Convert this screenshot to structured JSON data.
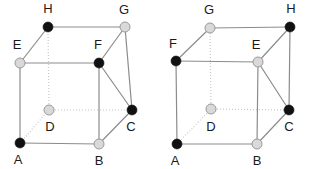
{
  "figure": {
    "background_color": "#ffffff",
    "width": 312,
    "height": 169,
    "colors": {
      "vertex_black": "#111111",
      "vertex_white_fill": "#d9d9d9",
      "vertex_white_stroke": "#9a9a9a",
      "edge_visible": "#8c8c8c",
      "edge_hidden": "#c9c9c9",
      "label_text": "#1a1a1a"
    },
    "geometry": {
      "vertex_radius": 5.0,
      "edge_width": 1.2,
      "hidden_edge_width": 1.2,
      "hidden_edge_dash": "1,2"
    }
  },
  "cubes": [
    {
      "id": "cube-left",
      "name": "left-cube",
      "vertices": [
        {
          "id": "A",
          "label": "A",
          "x": 20,
          "y": 143,
          "color": "black",
          "label_x": 18,
          "label_y": 161
        },
        {
          "id": "B",
          "label": "B",
          "x": 99,
          "y": 144,
          "color": "white",
          "label_x": 99,
          "label_y": 162
        },
        {
          "id": "C",
          "label": "C",
          "x": 132,
          "y": 110,
          "color": "black",
          "label_x": 131,
          "label_y": 128
        },
        {
          "id": "D",
          "label": "D",
          "x": 49,
          "y": 110,
          "color": "white",
          "label_x": 50,
          "label_y": 128
        },
        {
          "id": "E",
          "label": "E",
          "x": 20,
          "y": 63,
          "color": "white",
          "label_x": 17,
          "label_y": 46
        },
        {
          "id": "F",
          "label": "F",
          "x": 99,
          "y": 63,
          "color": "black",
          "label_x": 98,
          "label_y": 46
        },
        {
          "id": "G",
          "label": "G",
          "x": 125,
          "y": 27,
          "color": "white",
          "label_x": 124,
          "label_y": 11
        },
        {
          "id": "H",
          "label": "H",
          "x": 48,
          "y": 27,
          "color": "black",
          "label_x": 48,
          "label_y": 10
        }
      ],
      "edges_visible": [
        [
          "A",
          "B"
        ],
        [
          "B",
          "C"
        ],
        [
          "A",
          "E"
        ],
        [
          "B",
          "F"
        ],
        [
          "C",
          "G"
        ],
        [
          "E",
          "F"
        ],
        [
          "F",
          "G"
        ],
        [
          "E",
          "H"
        ],
        [
          "F",
          "C"
        ],
        [
          "G",
          "H"
        ]
      ],
      "edges_hidden": [
        [
          "A",
          "D"
        ],
        [
          "D",
          "C"
        ],
        [
          "D",
          "H"
        ]
      ]
    },
    {
      "id": "cube-right",
      "name": "right-cube",
      "vertices": [
        {
          "id": "A",
          "label": "A",
          "x": 177,
          "y": 144,
          "color": "black",
          "label_x": 175,
          "label_y": 162
        },
        {
          "id": "B",
          "label": "B",
          "x": 257,
          "y": 144,
          "color": "white",
          "label_x": 257,
          "label_y": 162
        },
        {
          "id": "C",
          "label": "C",
          "x": 289,
          "y": 110,
          "color": "black",
          "label_x": 289,
          "label_y": 128
        },
        {
          "id": "D",
          "label": "D",
          "x": 211,
          "y": 109,
          "color": "white",
          "label_x": 211,
          "label_y": 128
        },
        {
          "id": "E",
          "label": "E",
          "x": 258,
          "y": 62,
          "color": "white",
          "label_x": 256,
          "label_y": 46
        },
        {
          "id": "F",
          "label": "F",
          "x": 176,
          "y": 61,
          "color": "black",
          "label_x": 173,
          "label_y": 45
        },
        {
          "id": "G",
          "label": "G",
          "x": 210,
          "y": 28,
          "color": "white",
          "label_x": 209,
          "label_y": 11
        },
        {
          "id": "H",
          "label": "H",
          "x": 290,
          "y": 27,
          "color": "black",
          "label_x": 291,
          "label_y": 10
        }
      ],
      "edges_visible": [
        [
          "A",
          "B"
        ],
        [
          "B",
          "C"
        ],
        [
          "A",
          "F"
        ],
        [
          "B",
          "E"
        ],
        [
          "C",
          "H"
        ],
        [
          "F",
          "E"
        ],
        [
          "E",
          "H"
        ],
        [
          "F",
          "G"
        ],
        [
          "E",
          "C"
        ],
        [
          "G",
          "H"
        ]
      ],
      "edges_hidden": [
        [
          "A",
          "D"
        ],
        [
          "D",
          "C"
        ],
        [
          "D",
          "G"
        ]
      ]
    }
  ]
}
